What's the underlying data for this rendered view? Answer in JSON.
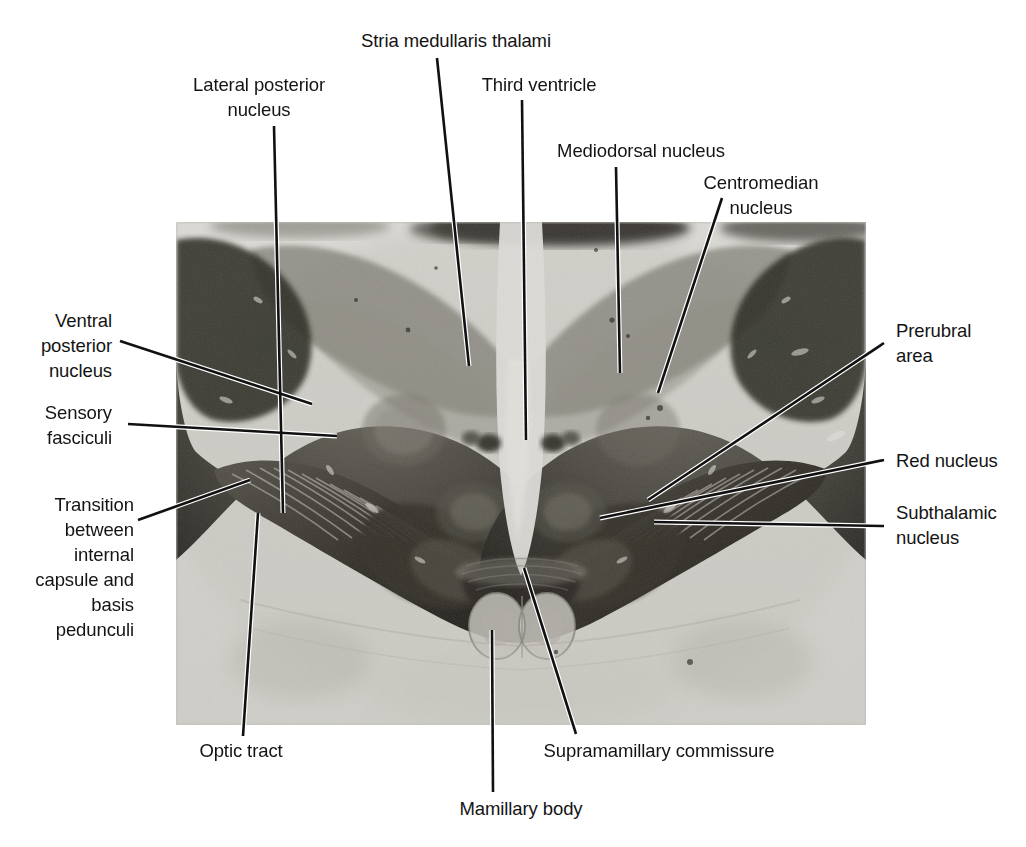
{
  "figure": {
    "kind": "anatomical-photomicrograph",
    "photo": {
      "x": 176,
      "y": 222,
      "width": 690,
      "height": 503,
      "tone_light": "#d9d8d4",
      "tone_mid": "#9a9890",
      "tone_dark": "#3a3832",
      "tone_darkest": "#1d1c19"
    },
    "leader_color_on_paper": "#111111",
    "leader_color_on_photo": "#ffffff"
  },
  "labels": [
    {
      "id": "stria-medullaris-thalami",
      "text": "Stria medullaris thalami",
      "align": "c",
      "box": {
        "left": 348,
        "top": 28,
        "width": 216
      },
      "leader": [
        [
          437,
          58
        ],
        [
          469,
          366
        ]
      ]
    },
    {
      "id": "lateral-posterior-nucleus",
      "text": "Lateral posterior\nnucleus",
      "align": "c",
      "box": {
        "left": 172,
        "top": 72,
        "width": 174
      },
      "leader": [
        [
          274,
          126
        ],
        [
          283,
          513
        ]
      ]
    },
    {
      "id": "third-ventricle",
      "text": "Third ventricle",
      "align": "c",
      "box": {
        "left": 474,
        "top": 72,
        "width": 130
      },
      "leader": [
        [
          522,
          100
        ],
        [
          526,
          440
        ]
      ]
    },
    {
      "id": "mediodorsal-nucleus",
      "text": "Mediodorsal nucleus",
      "align": "c",
      "box": {
        "left": 542,
        "top": 138,
        "width": 198
      },
      "leader": [
        [
          616,
          167
        ],
        [
          620,
          373
        ]
      ]
    },
    {
      "id": "centromedian-nucleus",
      "text": "Centromedian nucleus",
      "align": "c",
      "box": {
        "left": 671,
        "top": 170,
        "width": 180
      },
      "leader": [
        [
          722,
          198
        ],
        [
          658,
          393
        ]
      ]
    },
    {
      "id": "ventral-posterior-nucleus",
      "text": "Ventral\nposterior\nnucleus",
      "align": "l",
      "box": {
        "left": 8,
        "top": 308,
        "width": 104
      },
      "leader": [
        [
          120,
          341
        ],
        [
          312,
          404
        ]
      ]
    },
    {
      "id": "sensory-fasciculi",
      "text": "Sensory\nfasciculi",
      "align": "l",
      "box": {
        "left": 8,
        "top": 400,
        "width": 104
      },
      "leader": [
        [
          128,
          424
        ],
        [
          337,
          436
        ]
      ]
    },
    {
      "id": "transition-internal-capsule-basis-pedunculi",
      "text": "Transition\nbetween\ninternal\ncapsule and\nbasis\npedunculi",
      "align": "l",
      "box": {
        "left": 8,
        "top": 492,
        "width": 126
      },
      "leader": [
        [
          138,
          520
        ],
        [
          250,
          480
        ]
      ]
    },
    {
      "id": "prerubral-area",
      "text": "Prerubral\narea",
      "align": "r",
      "box": {
        "left": 896,
        "top": 318,
        "width": 110
      },
      "leader": [
        [
          884,
          343
        ],
        [
          648,
          500
        ]
      ]
    },
    {
      "id": "red-nucleus",
      "text": "Red nucleus",
      "align": "r",
      "box": {
        "left": 896,
        "top": 448,
        "width": 120
      },
      "leader": [
        [
          884,
          460
        ],
        [
          600,
          518
        ]
      ]
    },
    {
      "id": "subthalamic-nucleus",
      "text": "Subthalamic\nnucleus",
      "align": "r",
      "box": {
        "left": 896,
        "top": 500,
        "width": 124
      },
      "leader": [
        [
          884,
          526
        ],
        [
          654,
          522
        ]
      ]
    },
    {
      "id": "optic-tract",
      "text": "Optic tract",
      "align": "c",
      "box": {
        "left": 186,
        "top": 738,
        "width": 110
      },
      "leader": [
        [
          243,
          736
        ],
        [
          258,
          513
        ]
      ]
    },
    {
      "id": "supramamillary-commissure",
      "text": "Supramamillary commissure",
      "align": "c",
      "box": {
        "left": 528,
        "top": 738,
        "width": 262
      },
      "leader": [
        [
          576,
          734
        ],
        [
          524,
          568
        ]
      ]
    },
    {
      "id": "mamillary-body",
      "text": "Mamillary body",
      "align": "c",
      "box": {
        "left": 448,
        "top": 796,
        "width": 146
      },
      "leader": [
        [
          493,
          792
        ],
        [
          492,
          630
        ]
      ]
    }
  ]
}
